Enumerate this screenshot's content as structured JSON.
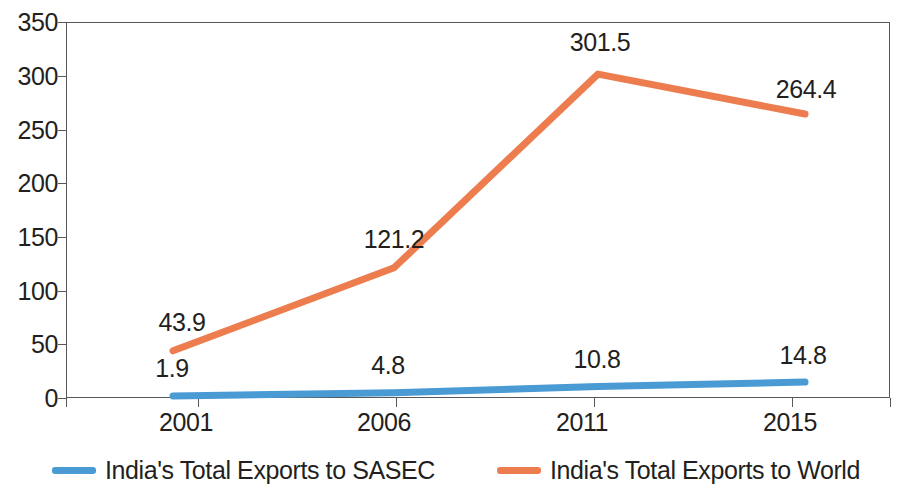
{
  "chart_data": {
    "type": "line",
    "title": "",
    "subtitle": "",
    "xlabel": "",
    "ylabel": "",
    "categories": [
      "2001",
      "2006",
      "2011",
      "2015"
    ],
    "series": [
      {
        "name": "India's Total Exports to SASEC",
        "color": "#4a9ad4",
        "values": [
          1.9,
          4.8,
          10.8,
          14.8
        ],
        "labels": [
          "1.9",
          "4.8",
          "10.8",
          "14.8"
        ]
      },
      {
        "name": "India's Total Exports to World",
        "color": "#ed7d4e",
        "values": [
          43.9,
          121.2,
          301.5,
          264.4
        ],
        "labels": [
          "43.9",
          "121.2",
          "301.5",
          "264.4"
        ]
      }
    ],
    "ylim": [
      0,
      350
    ],
    "yticks": [
      0,
      50,
      100,
      150,
      200,
      250,
      300,
      350
    ],
    "ytick_labels": [
      "0",
      "50",
      "100",
      "150",
      "200",
      "250",
      "300",
      "350"
    ],
    "grid": false,
    "legend_position": "bottom"
  },
  "axis": {
    "y_labels": [
      "350",
      "300",
      "250",
      "200",
      "150",
      "100",
      "50",
      "0"
    ],
    "x_labels": [
      "2001",
      "2006",
      "2011",
      "2015"
    ]
  },
  "legend": {
    "items": [
      {
        "label": "India's Total Exports to SASEC",
        "color": "#4a9ad4"
      },
      {
        "label": "India's Total Exports to World",
        "color": "#ed7d4e"
      }
    ]
  },
  "labels": {
    "sasec": [
      "1.9",
      "4.8",
      "10.8",
      "14.8"
    ],
    "world": [
      "43.9",
      "121.2",
      "301.5",
      "264.4"
    ]
  }
}
